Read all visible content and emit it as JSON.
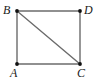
{
  "figure": {
    "kind": "geometry-diagram",
    "shape_name": "square-with-diagonal",
    "background_color": "#ffffff",
    "edge_color": "#6b6b6b",
    "diagonal_color": "#6b6b6b",
    "vertex_dot_color": "#111111",
    "label_color": "#1a1a1a",
    "vertices": [
      {
        "id": "B",
        "label": "B",
        "x": 17,
        "y": 11,
        "label_x": 3,
        "label_y": 4,
        "position": "top-left"
      },
      {
        "id": "D",
        "label": "D",
        "x": 80,
        "y": 11,
        "label_x": 84,
        "label_y": 4,
        "position": "top-right"
      },
      {
        "id": "A",
        "label": "A",
        "x": 17,
        "y": 64,
        "label_x": 10,
        "label_y": 67,
        "position": "bottom-left"
      },
      {
        "id": "C",
        "label": "C",
        "x": 80,
        "y": 64,
        "label_x": 77,
        "label_y": 67,
        "position": "bottom-right"
      }
    ],
    "edges": [
      {
        "id": "BD",
        "from": "B",
        "to": "D",
        "style": "solid",
        "role": "top-side"
      },
      {
        "id": "DC",
        "from": "D",
        "to": "C",
        "style": "solid",
        "role": "right-side"
      },
      {
        "id": "CA",
        "from": "C",
        "to": "A",
        "style": "solid",
        "role": "bottom-side"
      },
      {
        "id": "AB",
        "from": "A",
        "to": "B",
        "style": "solid",
        "role": "left-side"
      },
      {
        "id": "BC",
        "from": "B",
        "to": "C",
        "style": "solid",
        "role": "diagonal"
      }
    ]
  }
}
